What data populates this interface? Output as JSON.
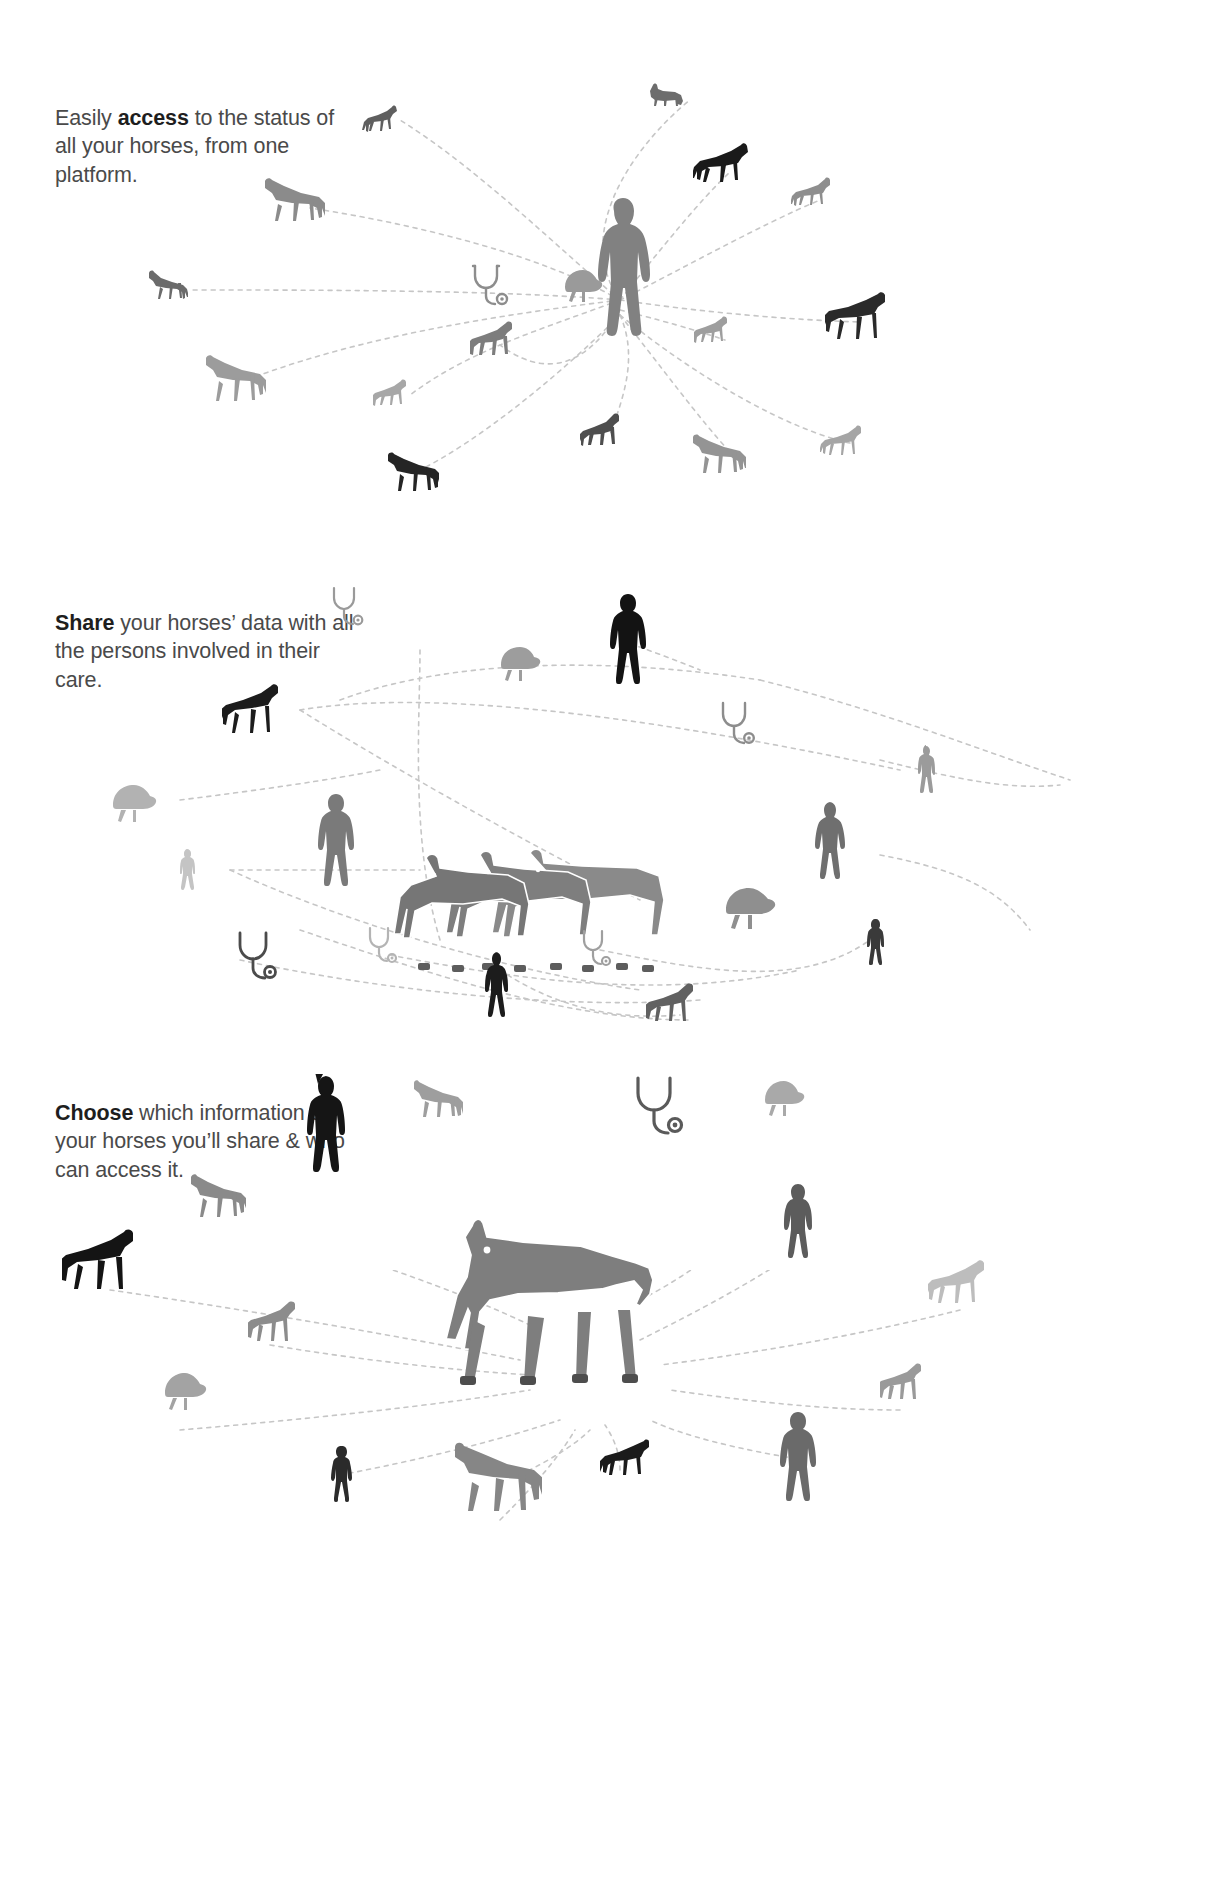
{
  "document": {
    "title": "Equine platform infographic",
    "background_color": "#ffffff",
    "text_color": "#4a4a4a",
    "emphasis_color": "#1e1e1e",
    "connector_color": "#bdbdbd"
  },
  "panels": [
    {
      "id": "access",
      "caption_lead": "Easily ",
      "caption_bold": "access",
      "caption_rest": " to the status of all your horses, from one platform.",
      "center_icon": "person-icon",
      "center_label": "platform user",
      "satellite_count": 15
    },
    {
      "id": "share",
      "caption_lead": "",
      "caption_bold": "Share",
      "caption_rest": " your horses’ data with all the persons involved in their care.",
      "center_icon": "horse-group-icon",
      "center_label": "group of three horses",
      "satellite_count": 16
    },
    {
      "id": "choose",
      "caption_lead": "",
      "caption_bold": "Choose",
      "caption_rest": " which information of your horses you’ll share & who can access it.",
      "center_icon": "horse-icon",
      "center_label": "single horse",
      "satellite_count": 16
    }
  ],
  "legend": {
    "icons": [
      {
        "name": "horse-icon",
        "meaning": "horse"
      },
      {
        "name": "foal-icon",
        "meaning": "foal"
      },
      {
        "name": "person-icon",
        "meaning": "person"
      },
      {
        "name": "stethoscope-icon",
        "meaning": "veterinarian"
      },
      {
        "name": "riding-helmet-icon",
        "meaning": "rider"
      }
    ]
  },
  "colors": {
    "silhouette_black": "#1a1a1a",
    "silhouette_dark": "#3b3b3b",
    "silhouette_mid": "#7d7d7d",
    "silhouette_light": "#b5b5b5",
    "silhouette_pale": "#d2d2d2",
    "connector": "#c6c6c6"
  }
}
